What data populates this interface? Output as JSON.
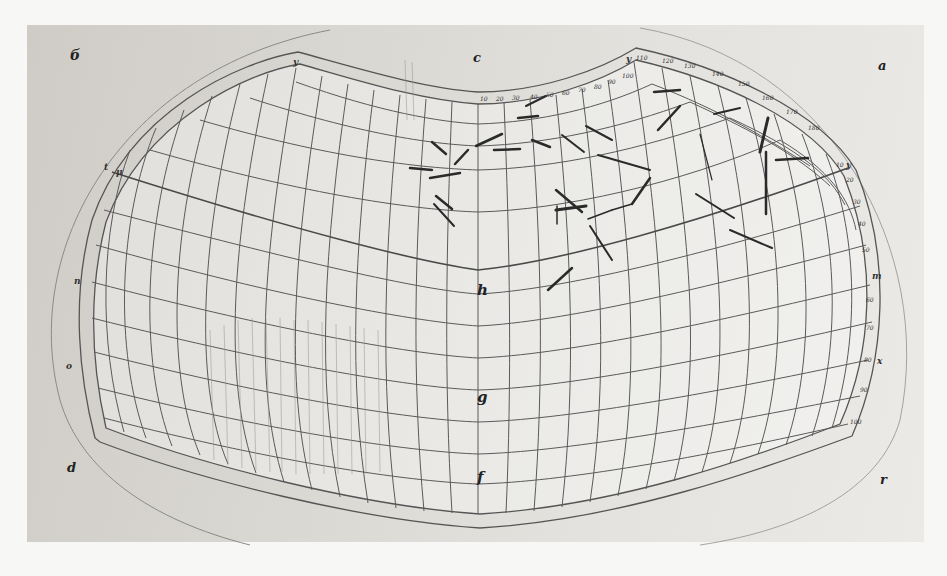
{
  "image": {
    "kind": "photograph of a manuscript map projection drawing",
    "description": "Hand-drawn curved graticule (Ptolemaic-style projection) on paper, with letter labels at corners and along the central meridian, and handwritten place-name annotations in the upper-right quadrant"
  },
  "corner_labels": {
    "top_left": "б",
    "top_center": "c",
    "top_right": "a",
    "bottom_left": "d",
    "bottom_right": "r"
  },
  "meridian_labels": {
    "upper": "h",
    "middle": "g",
    "lower": "f"
  },
  "frame_labels": {
    "top_left_vertex": "y",
    "top_right_vertex": "y",
    "left_upper_outer": "t",
    "left_upper_inner": "μ",
    "left_mid": "n",
    "left_lower": "o",
    "right_upper": "y",
    "right_mid": "m",
    "right_lower": "x"
  },
  "scale_numerals_top": [
    "10",
    "20",
    "30",
    "40",
    "50",
    "60",
    "70",
    "80",
    "90",
    "100",
    "110",
    "120",
    "130",
    "140",
    "150",
    "160",
    "170",
    "180"
  ],
  "scale_numerals_right": [
    "10",
    "20",
    "30",
    "40",
    "50",
    "60",
    "70",
    "80",
    "90",
    "100",
    "110"
  ],
  "annotations_count": 30,
  "colors": {
    "paper": "#d8d6d1",
    "ink": "#2a2a2a",
    "grid": "#5a5a5a",
    "background": "#f7f7f6"
  }
}
